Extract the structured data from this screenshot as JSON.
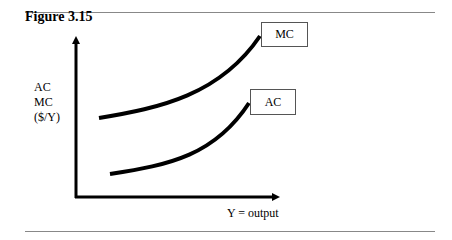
{
  "figure": {
    "title": "Figure 3.15",
    "y_axis_label": [
      "AC",
      "MC",
      "($/Y)"
    ],
    "x_axis_label": "Y = output",
    "curves": [
      {
        "name": "MC",
        "label": "MC"
      },
      {
        "name": "AC",
        "label": "AC"
      }
    ]
  }
}
